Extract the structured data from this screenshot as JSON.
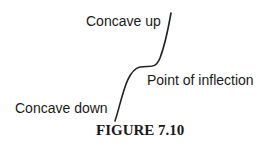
{
  "figure": {
    "caption": "FIGURE 7.10",
    "labels": {
      "concave_up": "Concave up",
      "point_of_inflection": "Point of inflection",
      "concave_down": "Concave down"
    },
    "curve_color": "#222222"
  }
}
